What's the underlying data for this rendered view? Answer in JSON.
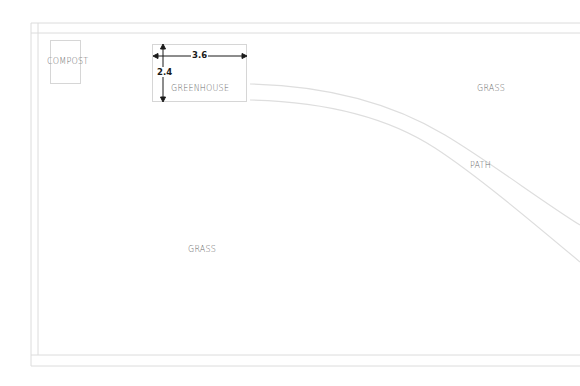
{
  "diagram": {
    "type": "garden site plan",
    "colors": {
      "background": "#ffffff",
      "outline": "#d9d9d9",
      "label_text": "#6a6a6a",
      "dimension": "#1a1a1a"
    },
    "areas": {
      "compost": {
        "label": "COMPOST"
      },
      "greenhouse": {
        "label": "GREENHOUSE",
        "width_dimension": "3.6",
        "height_dimension": "2.4"
      },
      "grass_upper_right": {
        "label": "GRASS"
      },
      "grass_lower_left": {
        "label": "GRASS"
      },
      "path": {
        "label": "PATH"
      }
    }
  }
}
